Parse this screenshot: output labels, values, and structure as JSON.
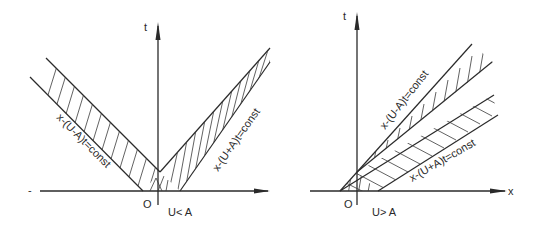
{
  "figure": {
    "left_panel": {
      "axis_t_label": "t",
      "axis_x_label": "",
      "axis_x_minus": "-",
      "origin_label": "O",
      "condition_label": "U< A",
      "band_left_label": "x-(U-A)t=const",
      "band_right_label": "x-(U+A)t=const"
    },
    "right_panel": {
      "axis_t_label": "t",
      "axis_x_label": "x",
      "origin_label": "O",
      "condition_label": "U> A",
      "band_upper_label": "x-(U-A)t=const",
      "band_lower_label": "x-(U+A)t=const"
    },
    "colors": {
      "ink": "#2a2a2a",
      "background": "#ffffff"
    }
  }
}
